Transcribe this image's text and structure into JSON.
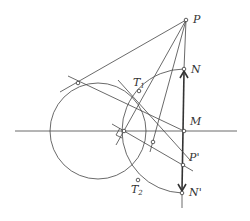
{
  "diagram": {
    "title": "",
    "points": [
      {
        "id": "P",
        "label": "P",
        "sub": "",
        "x": 186,
        "y": 20
      },
      {
        "id": "N",
        "label": "N",
        "sub": "",
        "x": 184,
        "y": 69
      },
      {
        "id": "M",
        "label": "M",
        "sub": "",
        "x": 184,
        "y": 131
      },
      {
        "id": "P_prime",
        "label": "P'",
        "sub": "",
        "x": 183,
        "y": 165
      },
      {
        "id": "N_prime",
        "label": "N'",
        "sub": "",
        "x": 182,
        "y": 193
      },
      {
        "id": "T1",
        "label": "T",
        "sub": "1",
        "x": 139,
        "y": 91
      },
      {
        "id": "T2",
        "label": "T",
        "sub": "2",
        "x": 138,
        "y": 180
      },
      {
        "id": "A",
        "label": "",
        "sub": "",
        "x": 78,
        "y": 83
      },
      {
        "id": "C",
        "label": "",
        "sub": "",
        "x": 124,
        "y": 131
      },
      {
        "id": "Q",
        "label": "",
        "sub": "",
        "x": 153,
        "y": 142
      }
    ],
    "labels": {
      "P": "P",
      "N": "N",
      "M": "M",
      "P_prime": "P'",
      "N_prime": "N'",
      "T1": "T",
      "T1_sub": "1",
      "T2": "T",
      "T2_sub": "2"
    },
    "colors": {
      "stroke": "#444444",
      "background": "#ffffff"
    }
  }
}
